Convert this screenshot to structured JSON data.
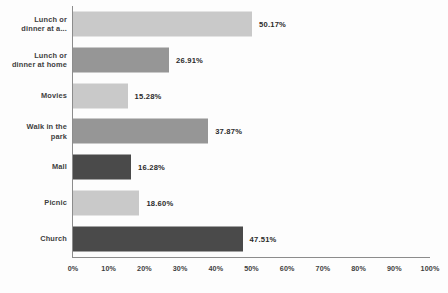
{
  "chart_data": {
    "type": "bar",
    "orientation": "horizontal",
    "title": "",
    "xlabel": "",
    "ylabel": "",
    "xlim": [
      0,
      100
    ],
    "grid": false,
    "legend": "none",
    "categories": [
      "Lunch or\ndinner at a...",
      "Lunch or\ndinner at home",
      "Movies",
      "Walk in the\npark",
      "Mall",
      "Picnic",
      "Church"
    ],
    "values": [
      50.17,
      26.91,
      15.28,
      37.87,
      16.28,
      18.6,
      47.51
    ],
    "data_labels": [
      "50.17%",
      "26.91%",
      "15.28%",
      "37.87%",
      "16.28%",
      "18.60%",
      "47.51%"
    ],
    "bar_colors": [
      "#c9c9c9",
      "#969696",
      "#c9c9c9",
      "#969696",
      "#4a4a4a",
      "#c9c9c9",
      "#4a4a4a"
    ],
    "xticks": [
      0,
      10,
      20,
      30,
      40,
      50,
      60,
      70,
      80,
      90,
      100
    ],
    "xtick_labels": [
      "0%",
      "10%",
      "20%",
      "30%",
      "40%",
      "50%",
      "60%",
      "70%",
      "80%",
      "90%",
      "100%"
    ],
    "axis_color": "#8c8c8c",
    "background": "#fdfdfd"
  }
}
